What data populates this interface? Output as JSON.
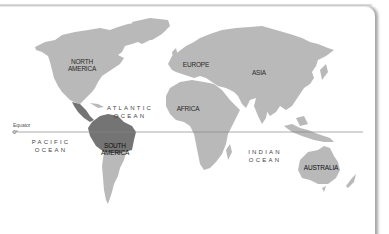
{
  "map": {
    "title": "World map highlighting northern South America",
    "colors": {
      "land": "#b9b9b9",
      "highlight": "#747474",
      "equator_line": "#888888",
      "background": "#ffffff"
    },
    "continents": [
      {
        "id": "north-america",
        "label_line1": "NORTH",
        "label_line2": "AMERICA"
      },
      {
        "id": "europe",
        "label_line1": "EUROPE",
        "label_line2": ""
      },
      {
        "id": "asia",
        "label_line1": "ASIA",
        "label_line2": ""
      },
      {
        "id": "africa",
        "label_line1": "AFRICA",
        "label_line2": ""
      },
      {
        "id": "south-america",
        "label_line1": "SOUTH",
        "label_line2": "AMERICA"
      },
      {
        "id": "australia",
        "label_line1": "AUSTRALIA",
        "label_line2": ""
      }
    ],
    "oceans": [
      {
        "id": "atlantic",
        "line1": "ATLANTIC",
        "line2": "OCEAN"
      },
      {
        "id": "pacific",
        "line1": "PACIFIC",
        "line2": "OCEAN"
      },
      {
        "id": "indian",
        "line1": "INDIAN",
        "line2": "OCEAN"
      }
    ],
    "equator": {
      "label": "Equator",
      "degree": "0°"
    }
  }
}
